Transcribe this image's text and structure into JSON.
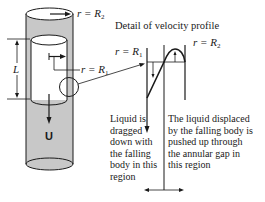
{
  "diagram": {
    "type": "falling-cylinder-viscometer",
    "labels": {
      "outer_radius": {
        "prefix": "r = R",
        "sub": "2"
      },
      "inner_radius": {
        "prefix": "r = R",
        "sub": "1"
      },
      "length": "L",
      "velocity": "U"
    },
    "detail": {
      "title": "Detail of velocity profile",
      "inner_radius": {
        "prefix": "r = R",
        "sub": "1"
      },
      "outer_radius": {
        "prefix": "r = R",
        "sub": "2"
      }
    },
    "annotations": {
      "left": "Liquid is\ndragged\ndown with\nthe falling\nbody in this\nregion",
      "right": "The liquid displaced\nby the falling body is\npushed up through\nthe annular gap in\nthis region"
    },
    "colors": {
      "liquid_fill": "#c8c8c8",
      "stroke": "#1a1a1a",
      "background": "#ffffff"
    }
  }
}
